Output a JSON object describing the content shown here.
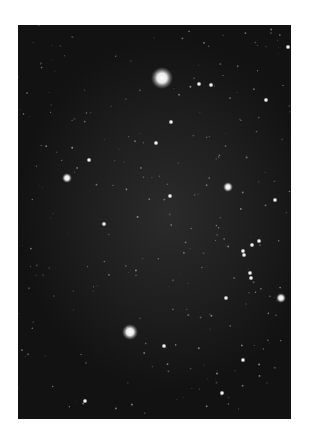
{
  "image": {
    "subject": "Star field photograph",
    "description": "Black-and-white astronomical photograph of a dense star field with a faint diffuse glow and several bright stars",
    "colors": {
      "page_background": "#ffffff",
      "sky_center": "#2b2b2b",
      "sky_edge": "#121212",
      "star_color": "#ffffff"
    },
    "stars": [
      {
        "name": "bright-star-top",
        "x": 144,
        "y": 53,
        "magnitude": "brightest"
      },
      {
        "name": "bright-star-bottom",
        "x": 112,
        "y": 307,
        "magnitude": "bright"
      },
      {
        "name": "star-left",
        "x": 49,
        "y": 153,
        "magnitude": "medium"
      },
      {
        "name": "star-mid-right",
        "x": 210,
        "y": 162,
        "magnitude": "medium"
      },
      {
        "name": "star-right-lower",
        "x": 263,
        "y": 273,
        "magnitude": "medium"
      },
      {
        "name": "star-upper-mid",
        "x": 153,
        "y": 97,
        "magnitude": "faint"
      },
      {
        "name": "star-top-right",
        "x": 270,
        "y": 22,
        "magnitude": "faint"
      },
      {
        "name": "star-right-upper",
        "x": 257,
        "y": 175,
        "magnitude": "faint"
      },
      {
        "name": "star-cluster-1",
        "x": 225,
        "y": 226,
        "magnitude": "faint"
      },
      {
        "name": "star-cluster-2",
        "x": 234,
        "y": 220,
        "magnitude": "faint"
      },
      {
        "name": "star-cluster-3",
        "x": 241,
        "y": 216,
        "magnitude": "faint"
      },
      {
        "name": "star-cluster-4",
        "x": 226,
        "y": 230,
        "magnitude": "faint"
      },
      {
        "name": "star-cluster-5",
        "x": 232,
        "y": 248,
        "magnitude": "faint"
      },
      {
        "name": "star-cluster-6",
        "x": 233,
        "y": 253,
        "magnitude": "faint"
      },
      {
        "name": "star-right-mid",
        "x": 208,
        "y": 273,
        "magnitude": "faint"
      },
      {
        "name": "star-lower-mid",
        "x": 146,
        "y": 321,
        "magnitude": "faint"
      },
      {
        "name": "star-lower-right",
        "x": 225,
        "y": 335,
        "magnitude": "faint"
      },
      {
        "name": "star-bottom-right",
        "x": 204,
        "y": 368,
        "magnitude": "faint"
      },
      {
        "name": "star-bottom-left",
        "x": 67,
        "y": 376,
        "magnitude": "faint"
      },
      {
        "name": "star-upper-right-a",
        "x": 181,
        "y": 59,
        "magnitude": "faint"
      },
      {
        "name": "star-upper-right-b",
        "x": 193,
        "y": 60,
        "magnitude": "faint"
      },
      {
        "name": "star-upper-right-c",
        "x": 248,
        "y": 75,
        "magnitude": "faint"
      },
      {
        "name": "star-center-a",
        "x": 152,
        "y": 171,
        "magnitude": "faint"
      },
      {
        "name": "star-center-b",
        "x": 138,
        "y": 118,
        "magnitude": "faint"
      },
      {
        "name": "star-left-upper",
        "x": 71,
        "y": 135,
        "magnitude": "faint"
      },
      {
        "name": "star-left-mid",
        "x": 86,
        "y": 199,
        "magnitude": "faint"
      }
    ]
  }
}
